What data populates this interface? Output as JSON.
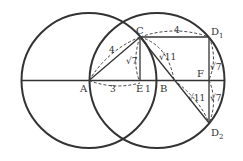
{
  "diagram": {
    "points": {
      "A": "A",
      "B": "B",
      "C": "C",
      "E": "E",
      "F": "F",
      "D1": "D",
      "D2": "D",
      "sub1": "1",
      "sub2": "2"
    },
    "lengths": {
      "AC": "4",
      "CD1": "4",
      "AE": "3",
      "EB": "1",
      "CE": "√7",
      "CB": "√11",
      "BD2": "√11",
      "D1F": "√7",
      "FD2": "√7"
    }
  }
}
